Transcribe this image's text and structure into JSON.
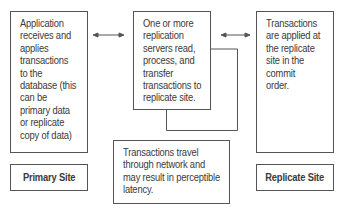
{
  "diagram": {
    "boxes": [
      {
        "id": "primary",
        "text": "Application\nreceives and\napplies\ntransactions\nto the\ndatabase (this\ncan be\nprimary data\nor replicate\ncopy of data)"
      },
      {
        "id": "replication-server",
        "text": "One or more\nreplication\nservers read,\nprocess, and\ntransfer\ntransactions to\nreplicate site."
      },
      {
        "id": "replicate",
        "text": "Transactions\nare applied at\nthe replicate\nsite in the\ncommit\norder."
      },
      {
        "id": "network-note",
        "text": "Transactions travel\nthrough network and\nmay result in perceptible\nlatency."
      }
    ],
    "labels": {
      "primary_site": "Primary Site",
      "replicate_site": "Replicate Site"
    },
    "colors": {
      "line": "#555555",
      "text": "#3a3a3a",
      "background": "#ffffff"
    }
  }
}
